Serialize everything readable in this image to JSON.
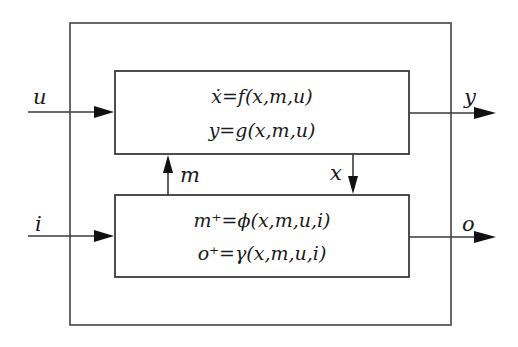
{
  "diagram": {
    "inputs": {
      "u_label": "u",
      "i_label": "i"
    },
    "outputs": {
      "y_label": "y",
      "o_label": "o"
    },
    "internal": {
      "m_label": "m",
      "x_label": "x"
    },
    "upper_block": {
      "eq1": "ẋ=f(x,m,u)",
      "eq2": "y=g(x,m,u)"
    },
    "lower_block": {
      "eq1": "m⁺=ϕ(x,m,u,i)",
      "eq2": "o⁺=γ(x,m,u,i)"
    },
    "colors": {
      "line": "#3a3a3a",
      "text": "#1a1a1a",
      "background": "#ffffff"
    }
  }
}
